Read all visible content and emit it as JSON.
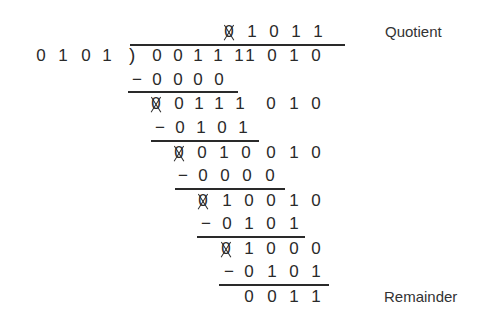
{
  "diagram": {
    "labels": {
      "quotient": "Quotient",
      "remainder": "Remainder"
    },
    "divisor": [
      "0",
      "1",
      "0",
      "1"
    ],
    "bracket": ")",
    "minus": "−",
    "struck_digit": "0",
    "quotient": [
      "0",
      "1",
      "0",
      "1",
      "1"
    ],
    "dividend": [
      "0",
      "0",
      "1",
      "1",
      "1",
      "1",
      "0",
      "1",
      "0"
    ],
    "steps": [
      {
        "subtract": [
          "0",
          "0",
          "0",
          "0"
        ],
        "result": [
          "0",
          "0",
          "1",
          "1",
          "1",
          "0",
          "1",
          "0"
        ]
      },
      {
        "subtract": [
          "0",
          "1",
          "0",
          "1"
        ],
        "result": [
          "0",
          "0",
          "1",
          "0",
          "0",
          "1",
          "0"
        ]
      },
      {
        "subtract": [
          "0",
          "0",
          "0",
          "0"
        ],
        "result": [
          "0",
          "1",
          "0",
          "0",
          "1",
          "0"
        ]
      },
      {
        "subtract": [
          "0",
          "1",
          "0",
          "1"
        ],
        "result": [
          "0",
          "1",
          "0",
          "0",
          "0"
        ]
      },
      {
        "subtract": [
          "0",
          "1",
          "0",
          "1"
        ],
        "result": [
          "0",
          "0",
          "1",
          "1"
        ]
      }
    ],
    "remainder": [
      "0",
      "0",
      "1",
      "1"
    ]
  }
}
